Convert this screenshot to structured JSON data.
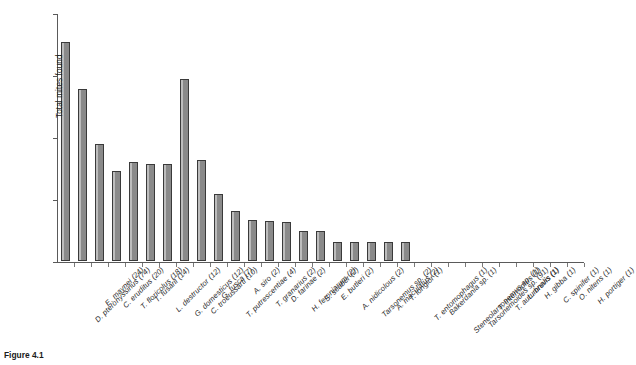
{
  "chart_data": {
    "type": "bar",
    "title": "",
    "xlabel": "",
    "ylabel": "Total mites found",
    "yscale": "log",
    "ylim": [
      1,
      10000
    ],
    "ytick_labels": [
      "1",
      "10",
      "100",
      "1000",
      "10 000"
    ],
    "ytick_values": [
      1,
      10,
      100,
      1000,
      10000
    ],
    "grid": false,
    "legend": null,
    "bar_color": "#8a8a8a",
    "bar_edge_color": "#3a3a3a",
    "categories": [
      "D. pteronyssinus (74)",
      "E. maynei (24)",
      "C. eruditus (20)",
      "T. floricolus (18)",
      "T. fusarii (14)",
      "L. destructor (12)",
      "G. domesticus (12)",
      "C. troeussarti (10)",
      "G. fusca (7)",
      "T. putrescentiae (4)",
      "A. siro (2)",
      "T. granarius (2)",
      "D. farinae (2)",
      "H. feroniarum (2)",
      "S. scaber (2)",
      "E. butleri (2)",
      "A. nidicolous (2)",
      "Tarsonemus sp. (2)",
      "A. maculatus (2)",
      "T. longior (1)",
      "T. entomophagus (1)",
      "Bakerdania sp. (1)",
      "Stenеolarsonemus sp. (1)",
      "Tarsonemoides sp. (91)",
      "T. interruptus (1)",
      "T. autumnalis (1)",
      "L. brevis (1)",
      "H. gibba (1)",
      "C. spinifer (1)",
      "O. nitens (1)",
      "H. portiger (1)"
    ],
    "values": [
      3400,
      600,
      77,
      28,
      40,
      37,
      37,
      860,
      42,
      12,
      6.5,
      4.6,
      4.4,
      4.3,
      3.0,
      3.0,
      2.0,
      2.0,
      2.0,
      2.0,
      2.0,
      1.0,
      1.0,
      1.0,
      1.0,
      1.0,
      1.0,
      1.0,
      1.0,
      1.0,
      1.0
    ]
  },
  "caption": {
    "figure_number": "Figure 4.1",
    "text": ""
  }
}
